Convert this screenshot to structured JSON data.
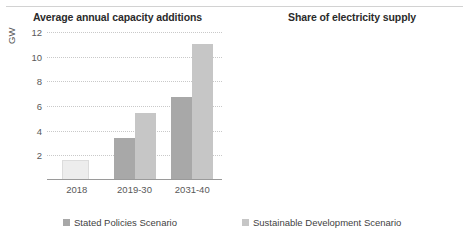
{
  "chart_data": [
    {
      "type": "bar",
      "title": "Average annual capacity additions",
      "xlabel": "",
      "ylabel": "GW",
      "categories": [
        "2018",
        "2019-30",
        "2031-40"
      ],
      "ylim": [
        0,
        12
      ],
      "yticks": [
        2,
        4,
        6,
        8,
        10,
        12
      ],
      "ytick_labels": [
        "2",
        "4",
        "6",
        "8",
        "10",
        "12"
      ],
      "grid": true,
      "legend_position": "bottom",
      "series": [
        {
          "name": "Historical",
          "values": [
            1.6,
            null,
            null
          ],
          "color": "#ededed",
          "show_in_legend": false
        },
        {
          "name": "Stated Policies Scenario",
          "values": [
            null,
            3.4,
            6.7
          ],
          "color": "#a8a8a8"
        },
        {
          "name": "Sustainable Development Scenario",
          "values": [
            null,
            5.4,
            11.0
          ],
          "color": "#c6c6c6"
        }
      ]
    },
    {
      "type": "line",
      "title": "Share of electricity supply",
      "xlabel": "",
      "ylabel": "",
      "x": [
        2018,
        2020,
        2022,
        2024,
        2026,
        2028,
        2030,
        2032,
        2034,
        2036,
        2038,
        2040
      ],
      "xlim": [
        2018,
        2040
      ],
      "xticks": [
        2018,
        2030,
        2040
      ],
      "xtick_labels": [
        "2018",
        "2030",
        "2040"
      ],
      "ylim": [
        0,
        6
      ],
      "yticks": [
        1,
        2,
        3,
        4,
        5,
        6
      ],
      "ytick_labels": [
        "1%",
        "2%",
        "3%",
        "4%",
        "5%",
        "6%"
      ],
      "grid": true,
      "legend_position": "bottom",
      "series": [
        {
          "name": "Stated Policies Scenario",
          "color": "#a8a8a8",
          "values": [
            0.2,
            0.3,
            0.45,
            0.62,
            0.82,
            1.05,
            1.3,
            1.6,
            1.9,
            2.2,
            2.55,
            2.9
          ]
        },
        {
          "name": "Sustainable Development Scenario",
          "color": "#c6c6c6",
          "values": [
            0.2,
            0.32,
            0.5,
            0.72,
            1.0,
            1.35,
            1.8,
            2.45,
            3.2,
            3.85,
            4.5,
            5.1
          ]
        }
      ]
    }
  ],
  "left_chart": {
    "title": "Average annual capacity additions",
    "ylabel": "GW",
    "yticks": [
      "12",
      "10",
      "8",
      "6",
      "4",
      "2"
    ],
    "xticks": [
      "2018",
      "2019-30",
      "2031-40"
    ],
    "legend_label": "Stated Policies Scenario"
  },
  "right_chart": {
    "title": "Share of electricity supply",
    "yticks": [
      "6%",
      "5%",
      "4%",
      "3%",
      "2%",
      "1%"
    ],
    "xticks": [
      "2018",
      "2030",
      "2040"
    ],
    "legend_label": "Sustainable Development Scenario"
  }
}
